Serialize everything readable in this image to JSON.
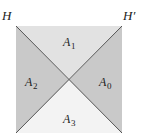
{
  "diagram": {
    "type": "square-divided-by-diagonals",
    "square": {
      "x": 16,
      "y": 26,
      "width": 106,
      "height": 107
    },
    "center": {
      "x": 69,
      "y": 80
    },
    "lines": [
      {
        "name": "H",
        "label": "H",
        "from": "top-left",
        "to": "bottom-right"
      },
      {
        "name": "H'",
        "label": "H′",
        "from": "top-right",
        "to": "bottom-left"
      }
    ],
    "regions": [
      {
        "id": "A1",
        "letter": "A",
        "subscript": "1",
        "position": "top",
        "fill": "#e2e2e2"
      },
      {
        "id": "A2",
        "letter": "A",
        "subscript": "2",
        "position": "left",
        "fill": "#c9c9c9"
      },
      {
        "id": "A0",
        "letter": "A",
        "subscript": "0",
        "position": "right",
        "fill": "#c9c9c9"
      },
      {
        "id": "A3",
        "letter": "A",
        "subscript": "3",
        "position": "bottom",
        "fill": "#f3f3f3"
      }
    ],
    "line_color": "#555555"
  },
  "labels": {
    "H": "H",
    "H_prime": "H′",
    "A1_letter": "A",
    "A1_sub": "1",
    "A2_letter": "A",
    "A2_sub": "2",
    "A0_letter": "A",
    "A0_sub": "0",
    "A3_letter": "A",
    "A3_sub": "3"
  }
}
